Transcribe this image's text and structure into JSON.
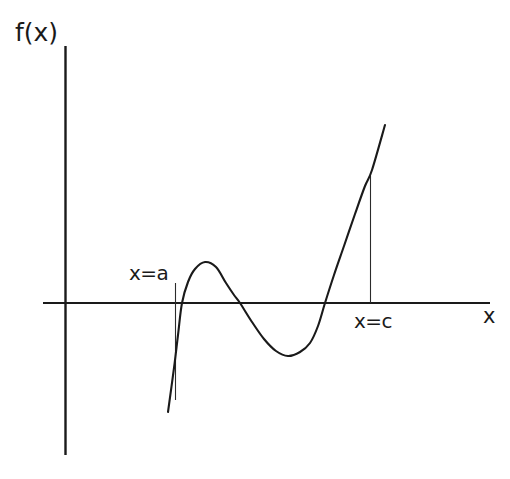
{
  "figure": {
    "background_color": "#ffffff",
    "ink_color": "#1a1a1a",
    "width": 510,
    "height": 479
  },
  "labels": {
    "y_axis": "f(x)",
    "x_axis": "x",
    "marker_a": "x=a",
    "marker_c": "x=c"
  },
  "chart_data": {
    "type": "line",
    "title": "",
    "subtitle": "",
    "xlabel": "x",
    "ylabel": "f(x)",
    "grid": false,
    "legend": null,
    "axes": {
      "x_axis_pixel_y": 303,
      "y_axis_pixel_x": 65,
      "x_axis_span_px": [
        43,
        490
      ],
      "y_axis_span_px": [
        46,
        455
      ],
      "origin_px": [
        65,
        303
      ],
      "ticks": [],
      "tick_labels": []
    },
    "annotations": [
      {
        "name": "marker-a",
        "label": "x=a",
        "x_px": 175,
        "label_position": "above-axis",
        "guide_line_px": {
          "x": 175,
          "y_top": 283,
          "y_bottom": 400
        }
      },
      {
        "name": "marker-c",
        "label": "x=c",
        "x_px": 370,
        "label_position": "below-axis",
        "guide_line_px": {
          "x": 370,
          "y_top": 176,
          "y_bottom": 303
        }
      }
    ],
    "series": [
      {
        "name": "f(x)",
        "description": "Smooth cubic-like curve: rises steeply from below the axis at x=a, crests to a local maximum, falls to a local minimum below the axis, then rises steeply through the axis and past x=c.",
        "color": "#1a1a1a",
        "points_px": [
          [
            168,
            412
          ],
          [
            174,
            368
          ],
          [
            178,
            335
          ],
          [
            182,
            303
          ],
          [
            188,
            282
          ],
          [
            195,
            269
          ],
          [
            205,
            262
          ],
          [
            216,
            267
          ],
          [
            226,
            283
          ],
          [
            234,
            295
          ],
          [
            240,
            303
          ],
          [
            252,
            322
          ],
          [
            264,
            339
          ],
          [
            276,
            351
          ],
          [
            288,
            356
          ],
          [
            300,
            352
          ],
          [
            310,
            343
          ],
          [
            318,
            326
          ],
          [
            325,
            303
          ],
          [
            334,
            275
          ],
          [
            344,
            246
          ],
          [
            355,
            214
          ],
          [
            365,
            186
          ],
          [
            372,
            170
          ],
          [
            385,
            125
          ]
        ],
        "zero_crossings_px": [
          182,
          240,
          325
        ],
        "local_max_px": [
          205,
          262
        ],
        "local_min_px": [
          288,
          356
        ],
        "endpoints_px": [
          [
            168,
            412
          ],
          [
            385,
            125
          ]
        ]
      }
    ]
  }
}
